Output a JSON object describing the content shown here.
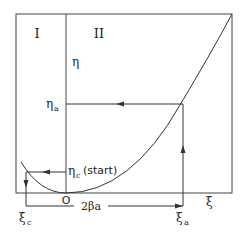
{
  "diagram": {
    "regions": {
      "left": "I",
      "right": "II"
    },
    "axis_labels": {
      "vertical": "η",
      "horizontal": "ξ",
      "origin": "O"
    },
    "points": {
      "eta_a": "η",
      "eta_a_sub": "a",
      "eta_c": "η",
      "eta_c_sub": "c",
      "eta_c_note": "(start)",
      "xi_c": "ξ",
      "xi_c_sub": "c",
      "xi_a": "ξ",
      "xi_a_sub": "a"
    },
    "span_label": "2βa",
    "colors": {
      "line": "#333333",
      "background": "#ffffff"
    }
  }
}
